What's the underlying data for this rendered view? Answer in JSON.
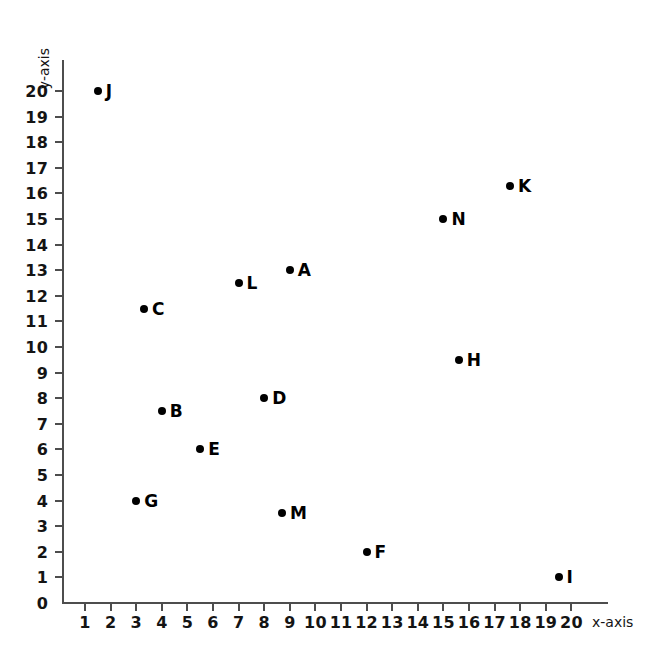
{
  "chart": {
    "type": "scatter",
    "title": "",
    "xlabel": "x-axis",
    "ylabel": "y-axis"
  },
  "chart_data": {
    "type": "scatter",
    "title": "",
    "xlabel": "x-axis",
    "ylabel": "y-axis",
    "xlim": [
      0,
      21
    ],
    "ylim": [
      0,
      20.8
    ],
    "grid": false,
    "legend": "none",
    "x_ticks": [
      1,
      2,
      3,
      4,
      5,
      6,
      7,
      8,
      9,
      10,
      11,
      12,
      13,
      14,
      15,
      16,
      17,
      18,
      19,
      20
    ],
    "x_tick_labels": [
      "1",
      "2",
      "3",
      "4",
      "5",
      "6",
      "7",
      "8",
      "9",
      "10",
      "11",
      "12",
      "13",
      "14",
      "15",
      "16",
      "17",
      "18",
      "19",
      "20"
    ],
    "y_ticks": [
      0,
      1,
      2,
      3,
      4,
      5,
      6,
      7,
      8,
      9,
      10,
      11,
      12,
      13,
      14,
      15,
      16,
      17,
      18,
      19,
      20
    ],
    "y_tick_labels": [
      "0",
      "1",
      "2",
      "3",
      "4",
      "5",
      "6",
      "7",
      "8",
      "9",
      "10",
      "11",
      "12",
      "13",
      "14",
      "15",
      "16",
      "17",
      "18",
      "19",
      "20"
    ],
    "origin_label": "0",
    "point_color": "#000000",
    "axis_color": "#4d4d4d",
    "points": [
      {
        "label": "A",
        "x": 9,
        "y": 13
      },
      {
        "label": "B",
        "x": 4,
        "y": 7.5
      },
      {
        "label": "C",
        "x": 3.3,
        "y": 11.5
      },
      {
        "label": "D",
        "x": 8,
        "y": 8
      },
      {
        "label": "E",
        "x": 5.5,
        "y": 6
      },
      {
        "label": "F",
        "x": 12,
        "y": 2
      },
      {
        "label": "G",
        "x": 3,
        "y": 4
      },
      {
        "label": "H",
        "x": 15.6,
        "y": 9.5
      },
      {
        "label": "I",
        "x": 19.5,
        "y": 1
      },
      {
        "label": "J",
        "x": 1.5,
        "y": 20
      },
      {
        "label": "K",
        "x": 17.6,
        "y": 16.3
      },
      {
        "label": "L",
        "x": 7,
        "y": 12.5
      },
      {
        "label": "M",
        "x": 8.7,
        "y": 3.5
      },
      {
        "label": "N",
        "x": 15,
        "y": 15
      }
    ]
  }
}
